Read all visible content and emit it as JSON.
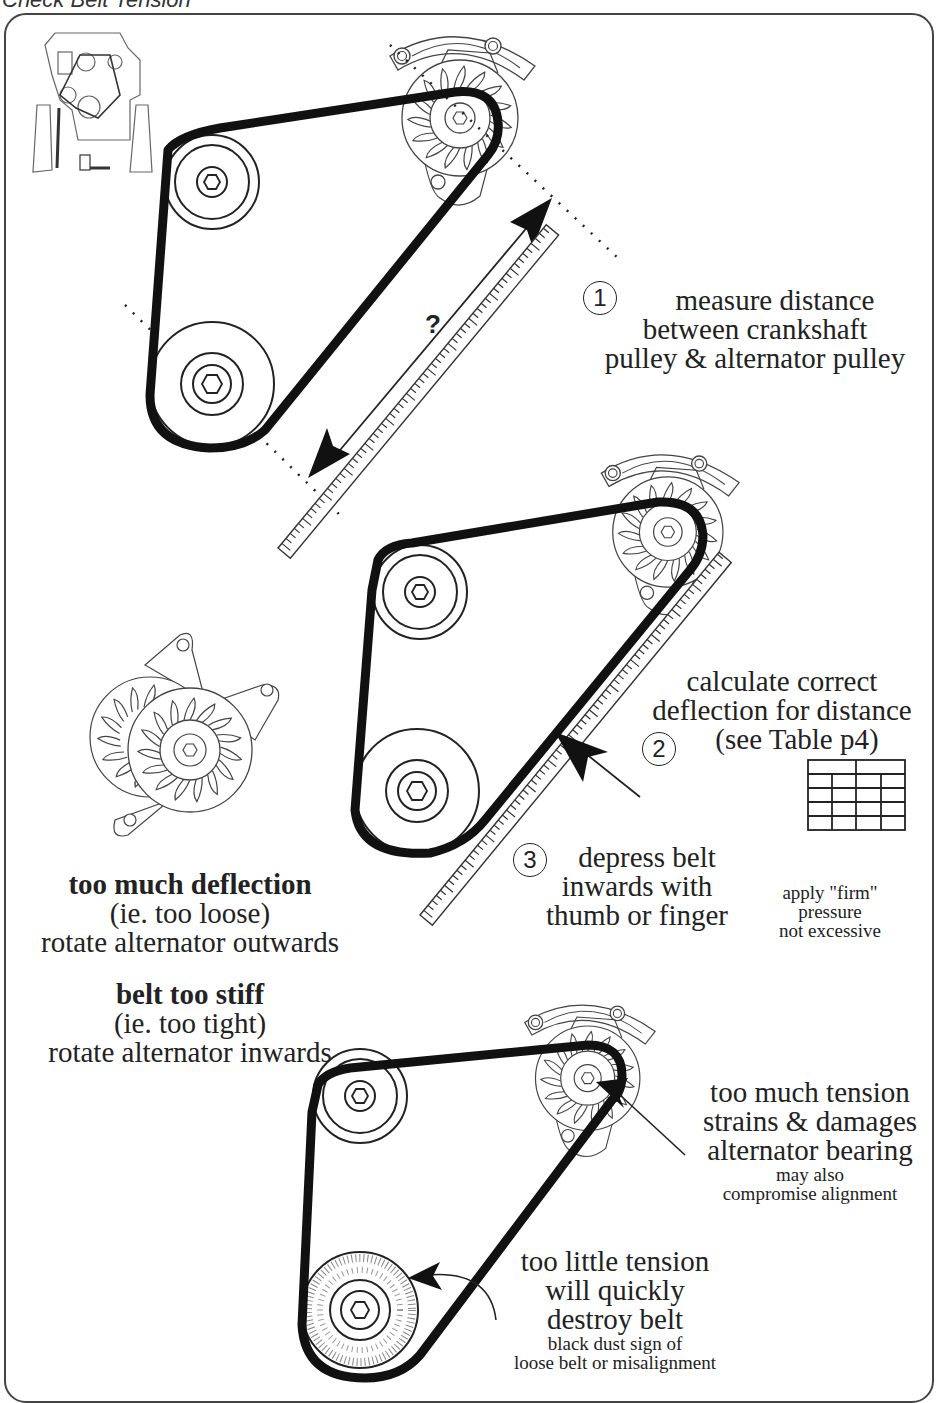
{
  "page": {
    "title": "Check Belt Tension"
  },
  "steps": [
    {
      "number": "1",
      "lines": [
        "measure distance",
        "between crankshaft",
        "pulley & alternator pulley"
      ]
    },
    {
      "number": "2",
      "lines": [
        "calculate correct",
        "deflection for distance",
        "(see Table p4)"
      ]
    },
    {
      "number": "3",
      "lines": [
        "depress belt",
        "inwards with",
        "thumb or finger"
      ]
    }
  ],
  "measurement_label": "?",
  "pressure_note": {
    "lines": [
      "apply \"firm\"",
      "pressure",
      "not excessive"
    ]
  },
  "deflection_guidance": {
    "too_loose": {
      "heading": "too much deflection",
      "detail": "(ie. too loose)",
      "action": "rotate alternator outwards"
    },
    "too_tight": {
      "heading": "belt too stiff",
      "detail": "(ie. too tight)",
      "action": "rotate alternator inwards"
    }
  },
  "tension_warnings": {
    "too_much": {
      "lines": [
        "too much tension",
        "strains & damages",
        "alternator bearing"
      ],
      "sub_lines": [
        "may also",
        "compromise alignment"
      ]
    },
    "too_little": {
      "lines": [
        "too little tension",
        "will quickly",
        "destroy belt"
      ],
      "sub_lines": [
        "black dust sign of",
        "loose belt or misalignment"
      ]
    }
  },
  "colors": {
    "belt": "#111111",
    "line_art": "#333333",
    "frame": "#444444",
    "background": "#ffffff"
  }
}
